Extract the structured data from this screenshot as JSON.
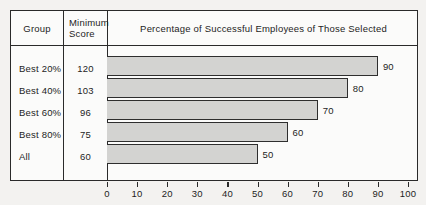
{
  "chart_data": {
    "type": "bar",
    "orientation": "horizontal",
    "title": "Percentage of Successful Employees of Those Selected",
    "xlabel": "",
    "ylabel": "",
    "xlim": [
      0,
      100
    ],
    "xticks": [
      0,
      10,
      20,
      30,
      40,
      50,
      60,
      70,
      80,
      90,
      100
    ],
    "grid": false,
    "legend": null,
    "categories": [
      "Best 20%",
      "Best 40%",
      "Best 60%",
      "Best 80%",
      "All"
    ],
    "values": [
      90,
      80,
      70,
      60,
      50
    ],
    "bar_fill_color": "#d3d3d1",
    "bar_edge_color": "#2e2e2e"
  },
  "table": {
    "headers": {
      "group": "Group",
      "minimum_line1": "Minimum",
      "minimum_line2": "Score",
      "percentage": "Percentage of Successful Employees of Those Selected"
    },
    "rows": [
      {
        "group": "Best 20%",
        "minimum_score": "120",
        "percentage": "90"
      },
      {
        "group": "Best 40%",
        "minimum_score": "103",
        "percentage": "80"
      },
      {
        "group": "Best 60%",
        "minimum_score": "96",
        "percentage": "70"
      },
      {
        "group": "Best 80%",
        "minimum_score": "75",
        "percentage": "60"
      },
      {
        "group": "All",
        "minimum_score": "60",
        "percentage": "50"
      }
    ]
  },
  "axis": {
    "tick_labels": [
      "0",
      "10",
      "20",
      "30",
      "40",
      "50",
      "60",
      "70",
      "80",
      "90",
      "100"
    ]
  }
}
